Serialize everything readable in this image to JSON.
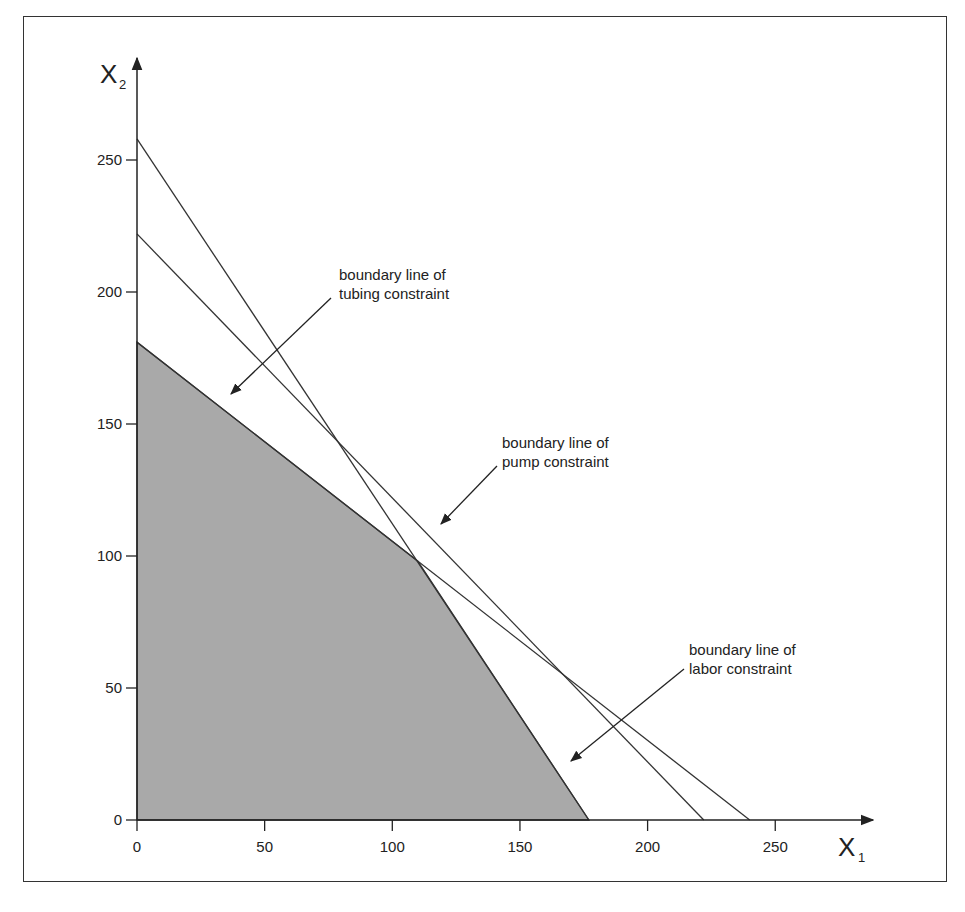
{
  "chart_data": {
    "type": "line",
    "title": "",
    "xlabel": "X",
    "xlabel_sub": "1",
    "ylabel": "X",
    "ylabel_sub": "2",
    "xlim": [
      0,
      280
    ],
    "ylim": [
      0,
      290
    ],
    "grid": false,
    "x_ticks": [
      0,
      50,
      100,
      150,
      200,
      250
    ],
    "y_ticks": [
      0,
      50,
      100,
      150,
      200,
      250
    ],
    "series": [
      {
        "name": "labor constraint boundary",
        "points": [
          [
            0,
            258
          ],
          [
            177,
            0
          ]
        ]
      },
      {
        "name": "pump constraint boundary",
        "points": [
          [
            0,
            222
          ],
          [
            222,
            0
          ]
        ]
      },
      {
        "name": "tubing constraint boundary",
        "points": [
          [
            0,
            181
          ],
          [
            240,
            0
          ]
        ]
      }
    ],
    "feasible_region": {
      "fill": "#a9a9a9",
      "vertices": [
        [
          0,
          0
        ],
        [
          0,
          181
        ],
        [
          110,
          98
        ],
        [
          177,
          0
        ]
      ]
    },
    "annotations": [
      {
        "line1": "boundary line of",
        "line2": "tubing constraint",
        "text_at": [
          79,
          208
        ],
        "arrow_from": [
          76,
          198
        ],
        "arrow_to": [
          36,
          161
        ]
      },
      {
        "line1": "boundary line of",
        "line2": "pump constraint",
        "text_at": [
          143,
          144
        ],
        "arrow_from": [
          141,
          134
        ],
        "arrow_to": [
          118,
          111
        ]
      },
      {
        "line1": "boundary line of",
        "line2": "labor constraint",
        "text_at": [
          216,
          64
        ],
        "arrow_from": [
          214,
          57
        ],
        "arrow_to": [
          169,
          21
        ]
      }
    ]
  },
  "colors": {
    "line": "#333333",
    "fill": "#a9a9a9",
    "frame": "#333333"
  }
}
